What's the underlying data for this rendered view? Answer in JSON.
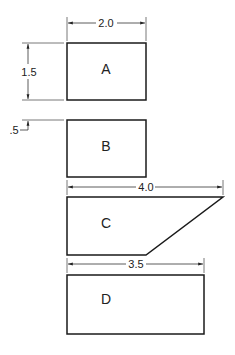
{
  "diagram": {
    "shapes": [
      {
        "id": "A",
        "label": "A",
        "type": "rectangle"
      },
      {
        "id": "B",
        "label": "B",
        "type": "rectangle"
      },
      {
        "id": "C",
        "label": "C",
        "type": "trapezoid"
      },
      {
        "id": "D",
        "label": "D",
        "type": "rectangle"
      }
    ],
    "dimensions": {
      "a_width": "2.0",
      "a_height": "1.5",
      "gap_ab": ".5",
      "c_width": "4.0",
      "d_width": "3.5"
    },
    "colors": {
      "line": "#1a1a1a",
      "background": "#ffffff"
    }
  }
}
